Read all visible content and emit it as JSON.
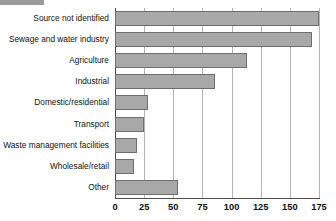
{
  "chart_data": {
    "type": "bar",
    "orientation": "horizontal",
    "title": "",
    "subtitle": "",
    "xlabel": "",
    "ylabel": "",
    "xlim": [
      0,
      175
    ],
    "ylim": null,
    "grid": true,
    "legend": null,
    "legend_position": "none",
    "xticks": [
      0,
      25,
      50,
      75,
      100,
      125,
      150,
      175
    ],
    "xtick_labels": [
      "0",
      "25",
      "50",
      "75",
      "100",
      "125",
      "150",
      "175"
    ],
    "categories": [
      "Source not identified",
      "Sewage and water industry",
      "Agriculture",
      "Industrial",
      "Domestic/residential",
      "Transport",
      "Waste management facilities",
      "Wholesale/retail",
      "Other"
    ],
    "values": [
      175,
      169,
      113,
      86,
      28,
      25,
      19,
      16,
      54
    ],
    "annotations": []
  },
  "style": {
    "bar_fill": "#a8a8a8",
    "bar_stroke": "#6e6e6e",
    "gridline_color": "#b4b4b4",
    "axis_color": "#4d4d4d",
    "background": "#ffffff",
    "text_color": "#111111"
  }
}
